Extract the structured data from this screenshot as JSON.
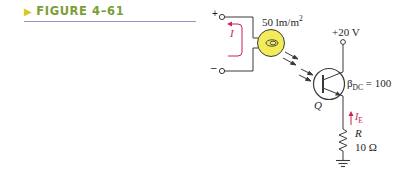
{
  "caption": {
    "marker": "▶",
    "label": "FIGURE 4–61"
  },
  "colors": {
    "caption_green": "#7a9e3a",
    "caption_marker": "#d6c81e",
    "caption_rule": "#8f96c4",
    "wire": "#3a3a3a",
    "current_arrow": "#c8254f",
    "photocell_fill": "#f2ec5a"
  },
  "circuit": {
    "plus_terminal": "+",
    "minus_terminal": "–",
    "loop_current_label": "I",
    "illuminance_label": "50 lm/m",
    "illuminance_exp": "2",
    "supply_label": "+20 V",
    "transistor_label": "Q",
    "beta_symbol": "β",
    "beta_sub": "DC",
    "beta_value": " = 100",
    "emitter_current_symbol": "I",
    "emitter_current_sub": "E",
    "resistor_label": "R",
    "resistor_value": "10 Ω"
  }
}
